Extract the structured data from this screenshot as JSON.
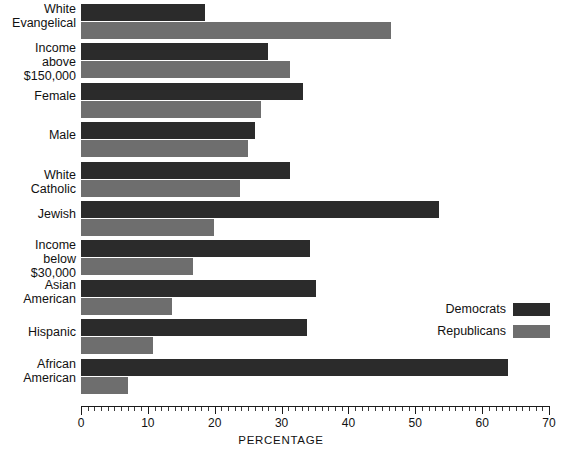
{
  "chart_data": {
    "type": "bar",
    "orientation": "horizontal",
    "title": "",
    "subtitle": "",
    "xlabel": "PERCENTAGE",
    "ylabel": "",
    "xlim": [
      0,
      70
    ],
    "grid": false,
    "legend_position": "middle-right",
    "categories": [
      "White\nEvangelical",
      "Income above\n$150,000",
      "Female",
      "Male",
      "White Catholic",
      "Jewish",
      "Income below\n$30,000",
      "Asian\nAmerican",
      "Hispanic",
      "African\nAmerican"
    ],
    "series": [
      {
        "name": "Democrats",
        "color": "#2b2b2b",
        "values": [
          18.5,
          28.0,
          33.2,
          26.0,
          31.3,
          53.5,
          34.2,
          35.1,
          33.8,
          63.9
        ]
      },
      {
        "name": "Republicans",
        "color": "#6e6e6e",
        "values": [
          46.4,
          31.3,
          26.9,
          25.0,
          23.8,
          19.9,
          16.8,
          13.6,
          10.8,
          7.0
        ]
      }
    ],
    "xticks_major": [
      0,
      10,
      20,
      30,
      40,
      50,
      60,
      70
    ],
    "xtick_labels": [
      "0",
      "10",
      "20",
      "30",
      "40",
      "50",
      "60",
      "70"
    ],
    "minor_tick_step": 1
  },
  "legend": {
    "items": [
      {
        "label": "Democrats",
        "color": "#2b2b2b"
      },
      {
        "label": "Republicans",
        "color": "#6e6e6e"
      }
    ]
  },
  "axis": {
    "title": "PERCENTAGE"
  }
}
